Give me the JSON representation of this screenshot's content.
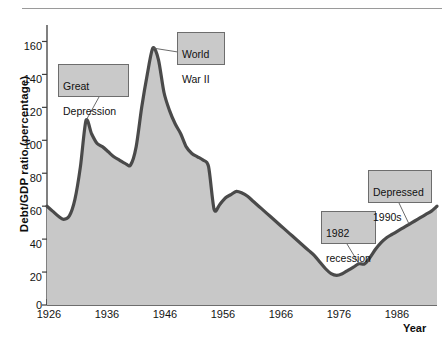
{
  "chart_data": {
    "type": "area",
    "title": "",
    "xlabel": "Year",
    "ylabel": "Debt/GDP ratio (percentage)",
    "xlim": [
      1926,
      1996
    ],
    "ylim": [
      0,
      170
    ],
    "grid": false,
    "legend": "none",
    "fill_color": "#c8c8c8",
    "line_color": "#4a4a4a",
    "xticks": [
      1926,
      1936,
      1946,
      1956,
      1966,
      1976,
      1986
    ],
    "xtick_labels": [
      "1926",
      "1936",
      "1946",
      "1956",
      "1966",
      "1976",
      "1986"
    ],
    "yticks": [
      0,
      20,
      40,
      60,
      80,
      100,
      120,
      140,
      160
    ],
    "ytick_labels": [
      "0",
      "20",
      "40",
      "60",
      "80",
      "100",
      "120",
      "140",
      "160"
    ],
    "x": [
      1926,
      1927,
      1928,
      1929,
      1930,
      1931,
      1932,
      1933,
      1934,
      1935,
      1936,
      1937,
      1938,
      1939,
      1940,
      1941,
      1942,
      1943,
      1944,
      1945,
      1946,
      1947,
      1948,
      1949,
      1950,
      1951,
      1952,
      1953,
      1954,
      1955,
      1956,
      1957,
      1958,
      1959,
      1960,
      1961,
      1962,
      1963,
      1964,
      1965,
      1966,
      1967,
      1968,
      1969,
      1970,
      1971,
      1972,
      1973,
      1974,
      1975,
      1976,
      1977,
      1978,
      1979,
      1980,
      1981,
      1982,
      1983,
      1984,
      1985,
      1986,
      1987,
      1988,
      1989,
      1990,
      1991,
      1992,
      1993,
      1994,
      1995,
      1996
    ],
    "y": [
      60,
      57,
      54,
      52,
      54,
      64,
      84,
      112,
      104,
      98,
      96,
      93,
      90,
      88,
      86,
      85,
      96,
      120,
      140,
      156,
      149,
      129,
      118,
      110,
      104,
      96,
      92,
      90,
      88,
      84,
      58,
      61,
      65,
      67,
      69,
      68,
      66,
      63,
      60,
      57,
      54,
      51,
      48,
      45,
      42,
      39,
      36,
      33,
      30,
      26,
      22,
      19,
      18,
      19,
      21,
      23,
      25,
      25,
      29,
      34,
      38,
      41,
      43,
      45,
      47,
      49,
      51,
      53,
      55,
      57,
      60
    ],
    "annotations": [
      {
        "label": "Great\nDepression",
        "text_line1": "Great",
        "text_line2": "Depression",
        "points_to_year": 1933,
        "points_to_value": 112
      },
      {
        "label": "World\nWar II",
        "text_line1": "World",
        "text_line2": "War II",
        "points_to_year": 1945,
        "points_to_value": 156
      },
      {
        "label": "1982\nrecession",
        "text_line1": "1982",
        "text_line2": "recession",
        "points_to_year": 1982,
        "points_to_value": 25
      },
      {
        "label": "Depressed\n1990s",
        "text_line1": "Depressed",
        "text_line2": "1990s",
        "points_to_year": 1991,
        "points_to_value": 49
      }
    ]
  }
}
